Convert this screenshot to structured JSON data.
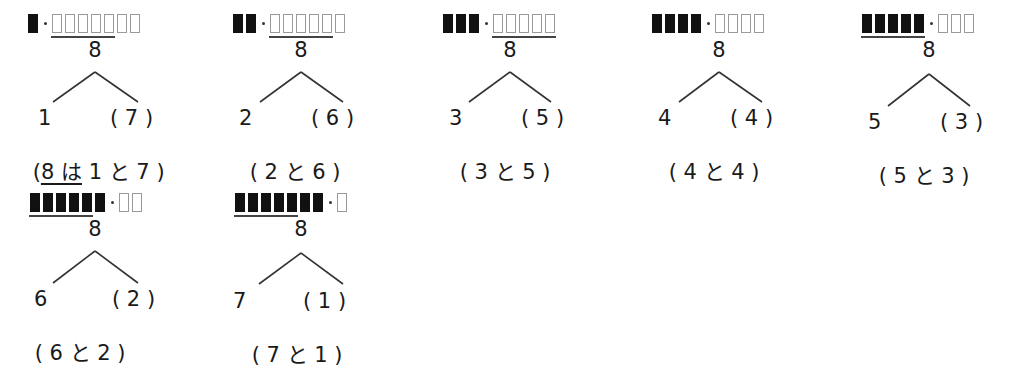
{
  "total": "8",
  "colors": {
    "filled_box": "#111111",
    "empty_box_border": "#9a9a9a",
    "line": "#333333"
  },
  "items": [
    {
      "filled": 1,
      "empty": 7,
      "underline": "empty5",
      "left": "1",
      "right": "( 7 )",
      "pair_pre": "(",
      "pair_u": "8 は",
      "pair_post": " 1 と 7 )"
    },
    {
      "filled": 2,
      "empty": 6,
      "underline": "empty5",
      "left": "2",
      "right": "( 6 )",
      "pair_pre": "( 2 と 6 )",
      "pair_u": "",
      "pair_post": ""
    },
    {
      "filled": 3,
      "empty": 5,
      "underline": "empty5",
      "left": "3",
      "right": "( 5 )",
      "pair_pre": "( 3 と 5 )",
      "pair_u": "",
      "pair_post": ""
    },
    {
      "filled": 4,
      "empty": 4,
      "underline": "none",
      "left": "4",
      "right": "( 4 )",
      "pair_pre": "( 4 と 4 )",
      "pair_u": "",
      "pair_post": ""
    },
    {
      "filled": 5,
      "empty": 3,
      "underline": "filled5",
      "left": "5",
      "right": "( 3 )",
      "pair_pre": "( 5 と 3 )",
      "pair_u": "",
      "pair_post": ""
    },
    {
      "filled": 6,
      "empty": 2,
      "underline": "filled5",
      "left": "6",
      "right": "( 2 )",
      "pair_pre": "( 6 と 2 )",
      "pair_u": "",
      "pair_post": ""
    },
    {
      "filled": 7,
      "empty": 1,
      "underline": "filled5",
      "left": "7",
      "right": "( 1 )",
      "pair_pre": "( 7 と 1 )",
      "pair_u": "",
      "pair_post": ""
    }
  ]
}
